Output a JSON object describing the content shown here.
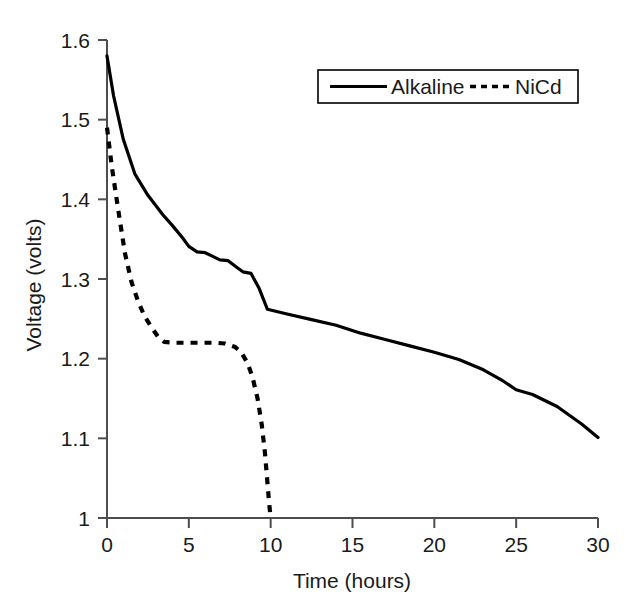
{
  "chart_data": {
    "type": "line",
    "title": "",
    "xlabel": "Time (hours)",
    "ylabel": "Voltage (volts)",
    "xlim": [
      0,
      30
    ],
    "ylim": [
      1.0,
      1.6
    ],
    "xticks": [
      "0",
      "5",
      "10",
      "15",
      "20",
      "25",
      "30"
    ],
    "xtick_values": [
      0,
      5,
      10,
      15,
      20,
      25,
      30
    ],
    "yticks": [
      "1",
      "1.1",
      "1.2",
      "1.3",
      "1.4",
      "1.5",
      "1.6"
    ],
    "ytick_values": [
      1.0,
      1.1,
      1.2,
      1.3,
      1.4,
      1.5,
      1.6
    ],
    "grid": false,
    "legend_position": "top-right",
    "series": [
      {
        "name": "Alkaline",
        "style": "solid",
        "color": "#000000",
        "x": [
          0.0,
          0.4,
          1.0,
          1.7,
          2.5,
          3.4,
          4.0,
          4.6,
          5.0,
          5.5,
          6.0,
          6.4,
          6.9,
          7.4,
          7.9,
          8.3,
          8.8,
          9.3,
          9.8,
          11.0,
          12.5,
          14.0,
          15.5,
          17.0,
          18.5,
          20.0,
          21.5,
          23.0,
          24.2,
          25.0,
          26.0,
          27.5,
          29.0,
          30.0
        ],
        "y": [
          1.58,
          1.53,
          1.475,
          1.432,
          1.405,
          1.381,
          1.367,
          1.352,
          1.341,
          1.334,
          1.333,
          1.329,
          1.324,
          1.323,
          1.315,
          1.309,
          1.307,
          1.288,
          1.262,
          1.256,
          1.249,
          1.242,
          1.232,
          1.224,
          1.216,
          1.208,
          1.199,
          1.186,
          1.172,
          1.161,
          1.155,
          1.14,
          1.118,
          1.101
        ]
      },
      {
        "name": "NiCd",
        "style": "dashed",
        "color": "#000000",
        "x": [
          0.0,
          0.3,
          0.7,
          1.1,
          1.5,
          1.9,
          2.3,
          2.7,
          3.1,
          3.5,
          4.2,
          5.0,
          5.8,
          6.6,
          7.2,
          7.8,
          8.2,
          8.6,
          8.9,
          9.2,
          9.45,
          9.65,
          9.8,
          9.9,
          10.0
        ],
        "y": [
          1.49,
          1.44,
          1.385,
          1.332,
          1.296,
          1.272,
          1.253,
          1.24,
          1.228,
          1.221,
          1.22,
          1.22,
          1.22,
          1.22,
          1.219,
          1.215,
          1.208,
          1.194,
          1.176,
          1.15,
          1.118,
          1.082,
          1.045,
          1.02,
          1.0
        ]
      }
    ]
  },
  "legend": {
    "entries": [
      {
        "label": "Alkaline",
        "style": "solid"
      },
      {
        "label": "NiCd",
        "style": "dashed"
      }
    ]
  }
}
